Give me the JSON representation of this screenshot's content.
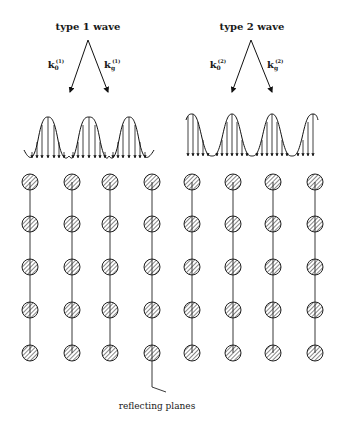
{
  "diagram": {
    "wave1": {
      "title": "type 1 wave",
      "k0_label": "k",
      "k0_sub": "0",
      "k0_sup": "(1)",
      "kg_label": "k",
      "kg_sub": "g",
      "kg_sup": "(1)",
      "alignment": "peaks on atom planes"
    },
    "wave2": {
      "title": "type 2 wave",
      "k0_label": "k",
      "k0_sub": "0",
      "k0_sup": "(2)",
      "kg_label": "k",
      "kg_sub": "g",
      "kg_sup": "(2)",
      "alignment": "peaks between atom planes"
    },
    "lattice": {
      "columns": 8,
      "rows": 5
    },
    "caption": "reflecting planes"
  }
}
